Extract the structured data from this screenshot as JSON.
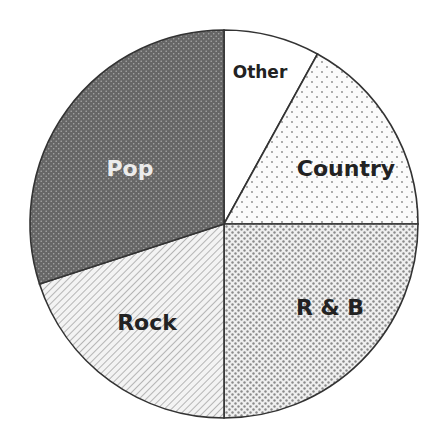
{
  "chart_data": {
    "type": "pie",
    "title": "",
    "start_angle_deg": 0,
    "direction": "clockwise",
    "categories": [
      "Other",
      "Country",
      "R & B",
      "Rock",
      "Pop"
    ],
    "values": [
      8,
      17,
      25,
      20,
      30
    ],
    "unit": "%",
    "slices": [
      {
        "label": "Other",
        "value": 8,
        "pattern": "plain",
        "fill": "#ffffff",
        "label_color": "#222222"
      },
      {
        "label": "Country",
        "value": 17,
        "pattern": "dots-sparse",
        "fill": "#f7f7f7",
        "label_color": "#222222"
      },
      {
        "label": "R & B",
        "value": 25,
        "pattern": "dots-dense",
        "fill": "#e4e4e4",
        "label_color": "#222222"
      },
      {
        "label": "Rock",
        "value": 20,
        "pattern": "diagonal",
        "fill": "#ededed",
        "label_color": "#222222"
      },
      {
        "label": "Pop",
        "value": 30,
        "pattern": "dark-dots",
        "fill": "#6e6e6e",
        "label_color": "#e8e8e8"
      }
    ],
    "legend": "none",
    "labels_inside": true
  },
  "labels": {
    "other": "Other",
    "country": "Country",
    "rnb": "R & B",
    "rock": "Rock",
    "pop": "Pop"
  }
}
